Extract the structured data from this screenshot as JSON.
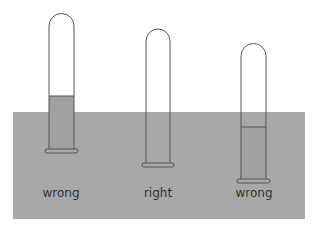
{
  "colors": {
    "basin": "#a8a8a8",
    "liquid": "#a0a0a0",
    "outline": "#444444"
  },
  "tubes": [
    {
      "label": "wrong",
      "liquid_level": "above basin surface"
    },
    {
      "label": "right",
      "liquid_level": "equal to basin surface"
    },
    {
      "label": "wrong",
      "liquid_level": "below basin surface"
    }
  ]
}
